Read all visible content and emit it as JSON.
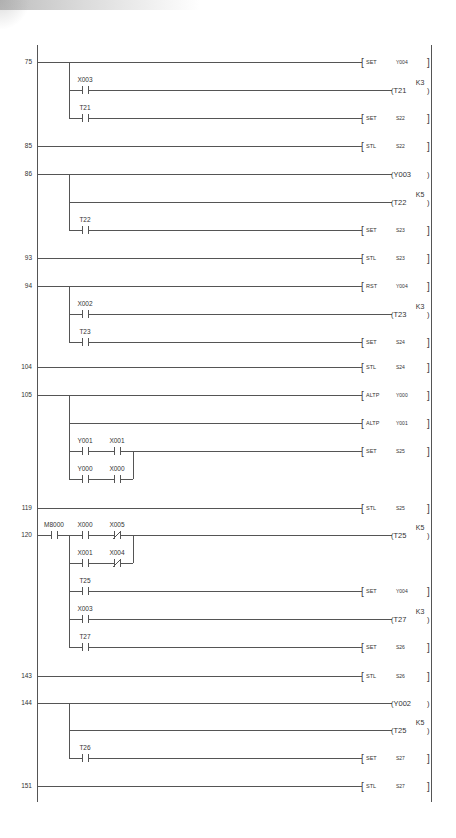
{
  "diagram": {
    "type": "ladder-logic",
    "rails": {
      "left_x": 37,
      "branch_x": 69,
      "right_x": 431,
      "top_y": 45,
      "bottom_y": 802
    },
    "rungs": [
      {
        "step": "75",
        "y": 62,
        "rows": [
          {
            "y": 62,
            "contacts": [],
            "output": {
              "kind": "instr",
              "op": "SET",
              "operand": "Y004"
            }
          },
          {
            "y": 90,
            "contacts": [
              {
                "name": "X003",
                "type": "NO",
                "x": 82
              }
            ],
            "output": {
              "kind": "coil",
              "operand": "T21",
              "k": "K3"
            }
          },
          {
            "y": 118,
            "contacts": [
              {
                "name": "T21",
                "type": "NO",
                "x": 82
              }
            ],
            "output": {
              "kind": "instr",
              "op": "SET",
              "operand": "S22"
            }
          }
        ]
      },
      {
        "step": "85",
        "y": 146,
        "rows": [
          {
            "y": 146,
            "contacts": [],
            "output": {
              "kind": "instr",
              "op": "STL",
              "operand": "S22"
            },
            "no_branch": true
          }
        ]
      },
      {
        "step": "86",
        "y": 174,
        "rows": [
          {
            "y": 174,
            "contacts": [],
            "output": {
              "kind": "coil",
              "operand": "Y003",
              "k": ""
            }
          },
          {
            "y": 202,
            "contacts": [],
            "output": {
              "kind": "coil",
              "operand": "T22",
              "k": "K5"
            }
          },
          {
            "y": 230,
            "contacts": [
              {
                "name": "T22",
                "type": "NO",
                "x": 82
              }
            ],
            "output": {
              "kind": "instr",
              "op": "SET",
              "operand": "S23"
            }
          }
        ]
      },
      {
        "step": "93",
        "y": 258,
        "rows": [
          {
            "y": 258,
            "contacts": [],
            "output": {
              "kind": "instr",
              "op": "STL",
              "operand": "S23"
            },
            "no_branch": true
          }
        ]
      },
      {
        "step": "94",
        "y": 286,
        "rows": [
          {
            "y": 286,
            "contacts": [],
            "output": {
              "kind": "instr",
              "op": "RST",
              "operand": "Y004"
            }
          },
          {
            "y": 314,
            "contacts": [
              {
                "name": "X002",
                "type": "NO",
                "x": 82
              }
            ],
            "output": {
              "kind": "coil",
              "operand": "T23",
              "k": "K3"
            }
          },
          {
            "y": 342,
            "contacts": [
              {
                "name": "T23",
                "type": "NO",
                "x": 82
              }
            ],
            "output": {
              "kind": "instr",
              "op": "SET",
              "operand": "S24"
            }
          }
        ]
      },
      {
        "step": "104",
        "y": 367,
        "rows": [
          {
            "y": 367,
            "contacts": [],
            "output": {
              "kind": "instr",
              "op": "STL",
              "operand": "S24"
            },
            "no_branch": true
          }
        ]
      },
      {
        "step": "105",
        "y": 395,
        "rows": [
          {
            "y": 395,
            "contacts": [],
            "output": {
              "kind": "instr",
              "op": "ALTP",
              "operand": "Y000"
            }
          },
          {
            "y": 423,
            "contacts": [],
            "output": {
              "kind": "instr",
              "op": "ALTP",
              "operand": "Y001"
            }
          },
          {
            "y": 451,
            "contacts": [
              {
                "name": "Y001",
                "type": "NO",
                "x": 82
              },
              {
                "name": "X001",
                "type": "NO",
                "x": 114
              }
            ],
            "output": {
              "kind": "instr",
              "op": "SET",
              "operand": "S25"
            },
            "or_join_x": 133
          },
          {
            "y": 479,
            "contacts": [
              {
                "name": "Y000",
                "type": "NO",
                "x": 82
              },
              {
                "name": "X000",
                "type": "NO",
                "x": 114
              }
            ],
            "output": null,
            "or_to": 451,
            "or_join_x": 133
          }
        ]
      },
      {
        "step": "119",
        "y": 508,
        "rows": [
          {
            "y": 508,
            "contacts": [],
            "output": {
              "kind": "instr",
              "op": "STL",
              "operand": "S25"
            },
            "no_branch": true
          }
        ]
      },
      {
        "step": "120",
        "y": 535,
        "pre_contact": {
          "name": "M8000",
          "type": "NO",
          "x": 51
        },
        "rows": [
          {
            "y": 535,
            "contacts": [
              {
                "name": "X000",
                "type": "NO",
                "x": 82
              },
              {
                "name": "X005",
                "type": "NC",
                "x": 114
              }
            ],
            "output": {
              "kind": "coil",
              "operand": "T25",
              "k": "K5"
            },
            "or_join_x": 133
          },
          {
            "y": 563,
            "contacts": [
              {
                "name": "X001",
                "type": "NO",
                "x": 82
              },
              {
                "name": "X004",
                "type": "NC",
                "x": 114
              }
            ],
            "output": null,
            "or_to": 535,
            "or_join_x": 133
          },
          {
            "y": 591,
            "contacts": [
              {
                "name": "T25",
                "type": "NO",
                "x": 82
              }
            ],
            "output": {
              "kind": "instr",
              "op": "SET",
              "operand": "Y004"
            }
          },
          {
            "y": 619,
            "contacts": [
              {
                "name": "X003",
                "type": "NO",
                "x": 82
              }
            ],
            "output": {
              "kind": "coil",
              "operand": "T27",
              "k": "K3"
            }
          },
          {
            "y": 647,
            "contacts": [
              {
                "name": "T27",
                "type": "NO",
                "x": 82
              }
            ],
            "output": {
              "kind": "instr",
              "op": "SET",
              "operand": "S26"
            }
          }
        ]
      },
      {
        "step": "143",
        "y": 676,
        "rows": [
          {
            "y": 676,
            "contacts": [],
            "output": {
              "kind": "instr",
              "op": "STL",
              "operand": "S26"
            },
            "no_branch": true
          }
        ]
      },
      {
        "step": "144",
        "y": 703,
        "rows": [
          {
            "y": 703,
            "contacts": [],
            "output": {
              "kind": "coil",
              "operand": "Y002",
              "k": ""
            }
          },
          {
            "y": 730,
            "contacts": [],
            "output": {
              "kind": "coil",
              "operand": "T25",
              "k": "K5"
            }
          },
          {
            "y": 758,
            "contacts": [
              {
                "name": "T26",
                "type": "NO",
                "x": 82
              }
            ],
            "output": {
              "kind": "instr",
              "op": "SET",
              "operand": "S27"
            }
          }
        ]
      },
      {
        "step": "151",
        "y": 786,
        "rows": [
          {
            "y": 786,
            "contacts": [],
            "output": {
              "kind": "instr",
              "op": "STL",
              "operand": "S27"
            },
            "no_branch": true
          }
        ]
      }
    ]
  }
}
